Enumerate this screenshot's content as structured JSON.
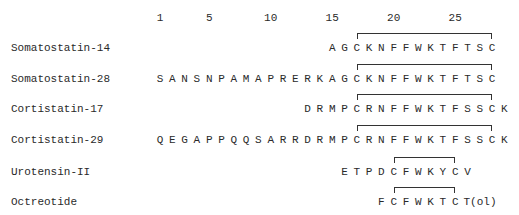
{
  "figure": {
    "type": "sequence-alignment",
    "position_ticks": [
      1,
      5,
      10,
      15,
      20,
      25
    ],
    "layout": {
      "pos1_x": 160,
      "residue_spacing": 12.3,
      "tick_y": 18,
      "row_y": [
        48,
        79,
        109,
        140,
        172,
        202
      ]
    },
    "peptides": [
      {
        "name": "Somatostatin-14",
        "start": 15,
        "residues": [
          "A",
          "G",
          "C",
          "K",
          "N",
          "F",
          "F",
          "W",
          "K",
          "T",
          "F",
          "T",
          "S",
          "C"
        ],
        "disulfide": [
          17,
          28
        ]
      },
      {
        "name": "Somatostatin-28",
        "start": 1,
        "residues": [
          "S",
          "A",
          "N",
          "S",
          "N",
          "P",
          "A",
          "M",
          "A",
          "P",
          "R",
          "E",
          "R",
          "K",
          "A",
          "G",
          "C",
          "K",
          "N",
          "F",
          "F",
          "W",
          "K",
          "T",
          "F",
          "T",
          "S",
          "C"
        ],
        "disulfide": [
          17,
          28
        ]
      },
      {
        "name": "Cortistatin-17",
        "start": 13,
        "residues": [
          "D",
          "R",
          "M",
          "P",
          "C",
          "R",
          "N",
          "F",
          "F",
          "W",
          "K",
          "T",
          "F",
          "S",
          "S",
          "C",
          "K"
        ],
        "disulfide": [
          17,
          28
        ]
      },
      {
        "name": "Cortistatin-29",
        "start": 1,
        "residues": [
          "Q",
          "E",
          "G",
          "A",
          "P",
          "P",
          "Q",
          "Q",
          "S",
          "A",
          "R",
          "R",
          "D",
          "R",
          "M",
          "P",
          "C",
          "R",
          "N",
          "F",
          "F",
          "W",
          "K",
          "T",
          "F",
          "S",
          "S",
          "C",
          "K"
        ],
        "disulfide": [
          17,
          28
        ]
      },
      {
        "name": "Urotensin-II",
        "start": 16,
        "residues": [
          "E",
          "T",
          "P",
          "D",
          "C",
          "F",
          "W",
          "K",
          "Y",
          "C",
          "V"
        ],
        "disulfide": [
          20,
          25
        ]
      },
      {
        "name": "Octreotide",
        "start": 19,
        "residues": [
          "F",
          "C",
          "F",
          "W",
          "K",
          "T",
          "C",
          "T(ol)"
        ],
        "disulfide": [
          20,
          25
        ]
      }
    ],
    "colors": {
      "text": "#2a2a2a",
      "bracket": "#333333",
      "background": "#ffffff"
    }
  }
}
